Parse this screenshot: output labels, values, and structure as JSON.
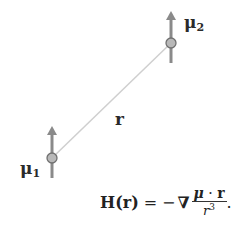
{
  "diagram": {
    "dipole_1": {
      "label_main": "μ",
      "label_sub": "1",
      "center": [
        52,
        158
      ]
    },
    "dipole_2": {
      "label_main": "μ",
      "label_sub": "2",
      "center": [
        171,
        43
      ]
    },
    "separation_label": "r",
    "colors": {
      "arrow": "#8a8a8a",
      "dipole_fill": "#b8b8b8",
      "dipole_stroke": "#707070",
      "connector_line": "#cfcfcf"
    }
  },
  "formula": {
    "lhs_symbol": "H",
    "lhs_arg": "(r)",
    "equals": "=",
    "minus": "−",
    "nabla": "∇",
    "numerator_mu": "μ",
    "numerator_dot": " · ",
    "numerator_r": "r",
    "denominator_base": "r",
    "denominator_exp": "3",
    "trailing": "."
  }
}
